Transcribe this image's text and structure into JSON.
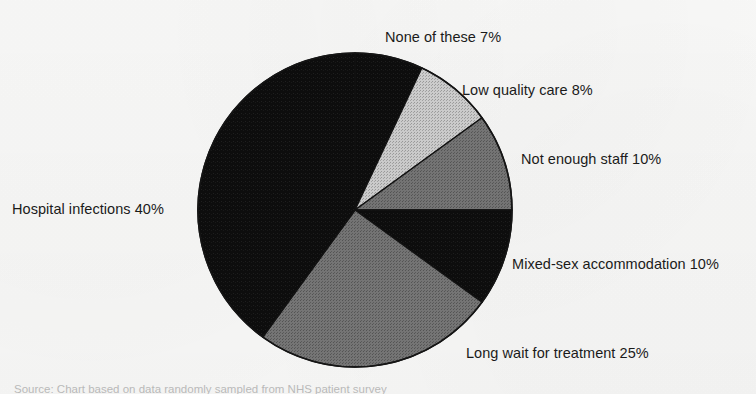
{
  "chart_data": {
    "type": "pie",
    "title": "",
    "subtitle": "",
    "xlabel": "",
    "ylabel": "",
    "legend_position": "outside-labels",
    "grid": false,
    "start_angle_deg": 0,
    "direction": "clockwise",
    "units": "%",
    "categories": [
      "None of these",
      "Low quality care",
      "Not enough staff",
      "Mixed-sex accommodation",
      "Long wait for treatment",
      "Hospital infections"
    ],
    "values": [
      7,
      8,
      10,
      10,
      25,
      40
    ],
    "slices": [
      {
        "label": "None of these",
        "value": 7,
        "value_text": "7%",
        "label_text": "None of these 7%",
        "color": "#0f0f0f",
        "start_deg": 0,
        "end_deg": 25.2
      },
      {
        "label": "Low quality care",
        "value": 8,
        "value_text": "8%",
        "label_text": "Low quality care 8%",
        "color": "#c5c5c5",
        "start_deg": 25.2,
        "end_deg": 54
      },
      {
        "label": "Not enough staff",
        "value": 10,
        "value_text": "10%",
        "label_text": "Not enough staff 10%",
        "color": "#545454",
        "start_deg": 54,
        "end_deg": 90
      },
      {
        "label": "Mixed-sex accommodation",
        "value": 10,
        "value_text": "10%",
        "label_text": "Mixed-sex accommodation 10%",
        "color": "#1c1c1c",
        "start_deg": 90,
        "end_deg": 126
      },
      {
        "label": "Long wait for treatment",
        "value": 25,
        "value_text": "25%",
        "label_text": "Long wait for treatment 25%",
        "color": "#6e6e6e",
        "start_deg": 126,
        "end_deg": 216
      },
      {
        "label": "Hospital infections",
        "value": 40,
        "value_text": "40%",
        "label_text": "Hospital infections 40%",
        "color": "#0d0d0d",
        "start_deg": 216,
        "end_deg": 360
      }
    ]
  },
  "labels": {
    "none_of_these": "None of these 7%",
    "low_quality_care": "Low quality care 8%",
    "not_enough_staff": "Not enough staff 10%",
    "mixed_sex_accommodation": "Mixed-sex accommodation 10%",
    "long_wait_for_treatment": "Long wait for treatment 25%",
    "hospital_infections": "Hospital infections 40%"
  },
  "caption": {
    "text": "Source: Chart based on data randomly sampled from NHS patient survey"
  },
  "colors": {
    "background": "#fbfbfa",
    "text": "#1b1b1b",
    "outline": "#111111",
    "slice_black": "#0d0d0d",
    "slice_near_black": "#1c1c1c",
    "slice_dark_gray": "#545454",
    "slice_mid_gray": "#6e6e6e",
    "slice_light_gray": "#c5c5c5"
  },
  "geometry": {
    "center_x": 355,
    "center_y": 210,
    "radius": 157
  }
}
